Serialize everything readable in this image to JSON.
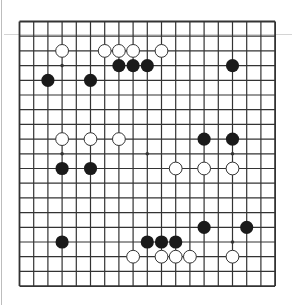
{
  "game": {
    "type": "go",
    "board_size": 19,
    "colors": {
      "background": "#ffffff",
      "grid_line": "#333333",
      "black_stone": "#1a1a1a",
      "white_stone_fill": "#ffffff",
      "white_stone_stroke": "#333333"
    },
    "star_points": [
      [
        3,
        3
      ],
      [
        3,
        9
      ],
      [
        3,
        15
      ],
      [
        9,
        3
      ],
      [
        9,
        9
      ],
      [
        9,
        15
      ],
      [
        15,
        3
      ],
      [
        15,
        9
      ],
      [
        15,
        15
      ]
    ],
    "stones": {
      "black": [
        [
          7,
          3
        ],
        [
          8,
          3
        ],
        [
          9,
          3
        ],
        [
          15,
          3
        ],
        [
          2,
          4
        ],
        [
          5,
          4
        ],
        [
          13,
          8
        ],
        [
          15,
          8
        ],
        [
          3,
          10
        ],
        [
          5,
          10
        ],
        [
          13,
          14
        ],
        [
          16,
          14
        ],
        [
          3,
          15
        ],
        [
          9,
          15
        ],
        [
          10,
          15
        ],
        [
          11,
          15
        ]
      ],
      "white": [
        [
          3,
          2
        ],
        [
          6,
          2
        ],
        [
          7,
          2
        ],
        [
          8,
          2
        ],
        [
          10,
          2
        ],
        [
          3,
          8
        ],
        [
          5,
          8
        ],
        [
          7,
          8
        ],
        [
          11,
          10
        ],
        [
          13,
          10
        ],
        [
          15,
          10
        ],
        [
          8,
          16
        ],
        [
          10,
          16
        ],
        [
          11,
          16
        ],
        [
          12,
          16
        ],
        [
          15,
          16
        ]
      ]
    }
  }
}
